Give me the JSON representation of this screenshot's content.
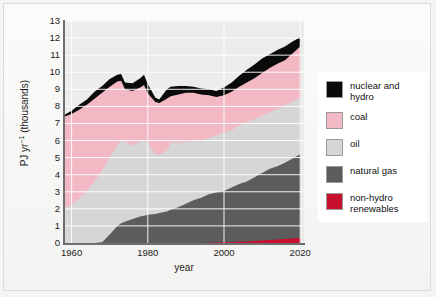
{
  "chart_data": {
    "type": "area",
    "stacked": true,
    "title": "",
    "xlabel": "year",
    "ylabel": "PJ yr⁻¹ (thousands)",
    "xlim": [
      1958,
      2021
    ],
    "ylim": [
      0,
      13
    ],
    "xticks": [
      1960,
      1980,
      2000,
      2020
    ],
    "yticks": [
      0,
      1,
      2,
      3,
      4,
      5,
      6,
      7,
      8,
      9,
      10,
      11,
      12,
      13
    ],
    "grid": "horizontal-and-vertical",
    "legend_position": "right",
    "colors": {
      "nuclear_and_hydro": "#0a0a0a",
      "coal": "#f2b9c4",
      "oil": "#d6d6d6",
      "natural_gas": "#5c5c5c",
      "non_hydro_renewables": "#c8102e",
      "plot_background": "#ececea",
      "gridline": "#ffffff",
      "axis": "#6e6e6e"
    },
    "x": [
      1958,
      1960,
      1962,
      1964,
      1966,
      1968,
      1970,
      1972,
      1973,
      1974,
      1976,
      1978,
      1979,
      1980,
      1982,
      1983,
      1985,
      1986,
      1988,
      1990,
      1992,
      1994,
      1996,
      1998,
      2000,
      2002,
      2004,
      2006,
      2008,
      2010,
      2012,
      2014,
      2016,
      2018,
      2020
    ],
    "series": [
      {
        "name": "non-hydro renewables",
        "key": "non_hydro_renewables",
        "color": "#c8102e",
        "values": [
          0,
          0,
          0,
          0,
          0,
          0,
          0,
          0,
          0,
          0,
          0,
          0,
          0,
          0,
          0,
          0,
          0,
          0,
          0,
          0,
          0,
          0,
          0.02,
          0.03,
          0.04,
          0.05,
          0.07,
          0.09,
          0.11,
          0.14,
          0.17,
          0.2,
          0.23,
          0.27,
          0.3
        ]
      },
      {
        "name": "natural gas",
        "key": "natural_gas",
        "color": "#5c5c5c",
        "values": [
          0,
          0,
          0,
          0,
          0,
          0.05,
          0.5,
          1.0,
          1.15,
          1.25,
          1.4,
          1.55,
          1.6,
          1.65,
          1.7,
          1.75,
          1.85,
          1.95,
          2.1,
          2.3,
          2.5,
          2.65,
          2.85,
          2.95,
          3.05,
          3.25,
          3.45,
          3.6,
          3.85,
          4.1,
          4.35,
          4.5,
          4.7,
          4.95,
          5.2
        ]
      },
      {
        "name": "oil",
        "key": "oil",
        "color": "#d6d6d6",
        "values": [
          2.05,
          2.25,
          2.6,
          3.05,
          3.6,
          4.25,
          5.0,
          5.75,
          6.0,
          5.95,
          5.7,
          5.95,
          6.0,
          5.85,
          5.2,
          5.15,
          5.4,
          5.9,
          5.85,
          5.9,
          5.95,
          6.0,
          6.15,
          6.3,
          6.45,
          6.6,
          6.9,
          7.1,
          7.25,
          7.45,
          7.65,
          7.85,
          8.05,
          8.3,
          8.5
        ]
      },
      {
        "name": "coal",
        "key": "coal",
        "color": "#f2b9c4",
        "values": [
          7.4,
          7.55,
          7.8,
          8.1,
          8.45,
          8.8,
          9.15,
          9.45,
          9.5,
          9.0,
          8.9,
          9.1,
          9.25,
          8.75,
          8.25,
          8.2,
          8.45,
          8.6,
          8.7,
          8.8,
          8.8,
          8.7,
          8.65,
          8.55,
          8.65,
          8.85,
          9.15,
          9.4,
          9.65,
          9.95,
          10.25,
          10.5,
          10.7,
          11.1,
          11.5
        ]
      },
      {
        "name": "nuclear and hydro",
        "key": "nuclear_and_hydro",
        "color": "#0a0a0a",
        "values": [
          7.5,
          7.75,
          8.1,
          8.4,
          8.85,
          9.2,
          9.6,
          9.85,
          9.9,
          9.4,
          9.35,
          9.65,
          9.85,
          9.3,
          8.5,
          8.4,
          9.0,
          9.15,
          9.2,
          9.2,
          9.15,
          9.05,
          9.0,
          8.9,
          9.1,
          9.4,
          9.8,
          10.15,
          10.45,
          10.8,
          11.05,
          11.3,
          11.5,
          11.8,
          12.05
        ]
      }
    ],
    "legend": [
      {
        "label": "nuclear and\nhydro",
        "color": "#0a0a0a",
        "key": "nuclear-and-hydro"
      },
      {
        "label": "coal",
        "color": "#f2b9c4",
        "key": "coal"
      },
      {
        "label": "oil",
        "color": "#d6d6d6",
        "key": "oil"
      },
      {
        "label": "natural gas",
        "color": "#5c5c5c",
        "key": "natural-gas"
      },
      {
        "label": "non-hydro\nrenewables",
        "color": "#c8102e",
        "key": "non-hydro-renewables"
      }
    ]
  }
}
